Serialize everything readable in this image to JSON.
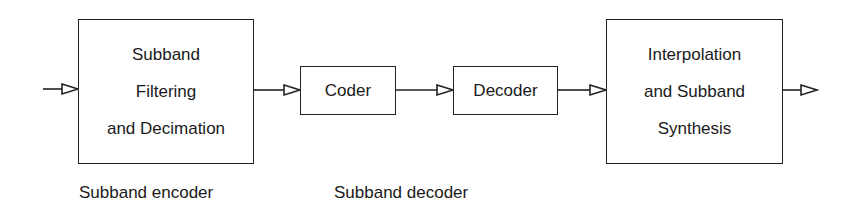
{
  "diagram": {
    "type": "block-diagram",
    "blocks": [
      {
        "id": "analysis",
        "lines": [
          "Subband",
          "Filtering",
          "and Decimation"
        ]
      },
      {
        "id": "coder",
        "lines": [
          "Coder"
        ]
      },
      {
        "id": "decoder",
        "lines": [
          "Decoder"
        ]
      },
      {
        "id": "synthesis",
        "lines": [
          "Interpolation",
          "and Subband",
          "Synthesis"
        ]
      }
    ],
    "labels": {
      "encoder": "Subband encoder",
      "decoder": "Subband decoder"
    },
    "flow": [
      "input",
      "analysis",
      "coder",
      "decoder",
      "synthesis",
      "output"
    ],
    "colors": {
      "line": "#222222",
      "background": "#ffffff"
    }
  }
}
